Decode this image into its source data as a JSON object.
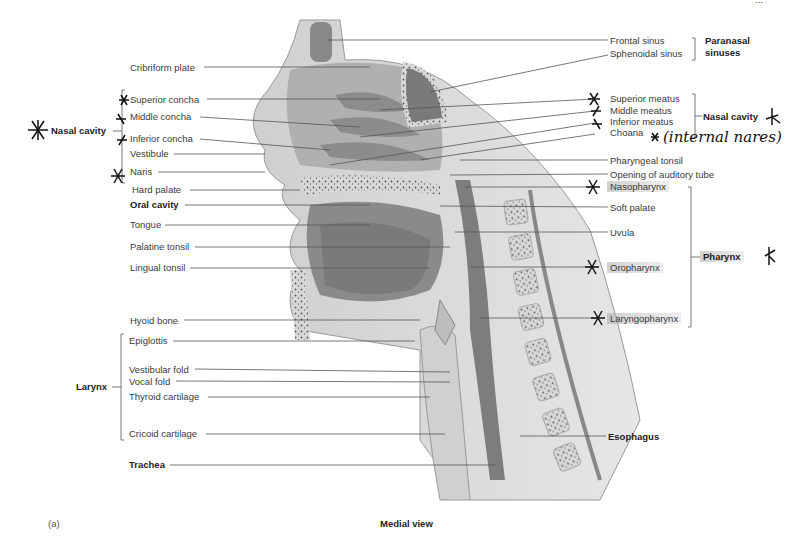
{
  "page": {
    "page_number_fragment": "...",
    "figure_letter": "(a)",
    "view_caption": "Medial view"
  },
  "left_labels": {
    "cribriform_plate": "Cribriform plate",
    "superior_concha": "Superior concha",
    "middle_concha": "Middle concha",
    "inferior_concha": "Inferior concha",
    "vestibule": "Vestibule",
    "naris": "Naris",
    "hard_palate": "Hard palate",
    "oral_cavity": "Oral cavity",
    "tongue": "Tongue",
    "palatine_tonsil": "Palatine tonsil",
    "lingual_tonsil": "Lingual tonsil",
    "hyoid_bone": "Hyoid bone",
    "epiglottis": "Epiglottis",
    "vestibular_fold": "Vestibular fold",
    "vocal_fold": "Vocal fold",
    "thyroid_cartilage": "Thyroid cartilage",
    "cricoid_cartilage": "Cricoid cartilage",
    "trachea": "Trachea"
  },
  "left_groups": {
    "nasal_cavity": "Nasal cavity",
    "larynx": "Larynx"
  },
  "right_labels": {
    "frontal_sinus": "Frontal sinus",
    "sphenoidal_sinus": "Sphenoidal sinus",
    "superior_meatus": "Superior meatus",
    "middle_meatus": "Middle meatus",
    "inferior_meatus": "Inferior meatus",
    "choana": "Choana",
    "pharyngeal_tonsil": "Pharyngeal tonsil",
    "opening_auditory_tube": "Opening of auditory tube",
    "nasopharynx": "Nasopharynx",
    "soft_palate": "Soft palate",
    "uvula": "Uvula",
    "oropharynx": "Oropharynx",
    "laryngopharynx": "Laryngopharynx",
    "esophagus": "Esophagus"
  },
  "right_groups": {
    "paranasal_sinuses_line1": "Paranasal",
    "paranasal_sinuses_line2": "sinuses",
    "nasal_cavity": "Nasal cavity",
    "pharynx": "Pharynx"
  },
  "annotations": {
    "internal_nares": "(internal nares)",
    "star_marks": [
      "Nasal cavity (left)",
      "Superior concha",
      "Middle concha",
      "Inferior concha",
      "Naris",
      "Superior meatus",
      "Middle meatus",
      "Inferior meatus",
      "Choana",
      "Nasal cavity (right)",
      "Nasopharynx",
      "Oropharynx",
      "Laryngopharynx",
      "Pharynx"
    ]
  },
  "colors": {
    "label_text": "#3a3a3a",
    "leader_line": "#555555",
    "tissue_light": "#dcdcdc",
    "tissue_mid": "#a8a8a8",
    "tissue_dark": "#6e6e6e",
    "highlighter": "#aaaaaa",
    "ink": "#111111"
  }
}
